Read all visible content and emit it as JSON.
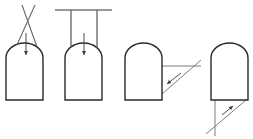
{
  "diagram": {
    "colors": {
      "background": "#ffffff",
      "outline": "#2a2a2a",
      "guide_lines": "#6e6e6e",
      "arrow": "#3a3a3a"
    },
    "panels": [
      {
        "id": "panel-1",
        "shape": {
          "left": 6,
          "right": 43,
          "arch_top": 43,
          "shoulder": 58,
          "bottom": 100
        },
        "lines": [
          {
            "x1": 22,
            "y1": 5,
            "x2": 37,
            "y2": 47
          },
          {
            "x1": 35,
            "y1": 5,
            "x2": 16,
            "y2": 47
          }
        ],
        "arrow": {
          "x1": 26,
          "y1": 33,
          "x2": 26,
          "y2": 55,
          "direction": "down"
        }
      },
      {
        "id": "panel-2",
        "shape": {
          "left": 65,
          "right": 102,
          "arch_top": 43,
          "shoulder": 58,
          "bottom": 100
        },
        "lines": [
          {
            "x1": 55,
            "y1": 10,
            "x2": 112,
            "y2": 10
          },
          {
            "x1": 71,
            "y1": 10,
            "x2": 71,
            "y2": 48
          },
          {
            "x1": 97,
            "y1": 10,
            "x2": 97,
            "y2": 48
          }
        ],
        "arrow": {
          "x1": 84,
          "y1": 33,
          "x2": 84,
          "y2": 55,
          "direction": "down"
        }
      },
      {
        "id": "panel-3",
        "shape": {
          "left": 125,
          "right": 162,
          "arch_top": 43,
          "shoulder": 58,
          "bottom": 100
        },
        "lines": [
          {
            "x1": 162,
            "y1": 66,
            "x2": 201,
            "y2": 66
          },
          {
            "x1": 162,
            "y1": 94,
            "x2": 201,
            "y2": 60
          }
        ],
        "arrow": {
          "x1": 181,
          "y1": 73,
          "x2": 167,
          "y2": 84,
          "direction": "down-left"
        }
      },
      {
        "id": "panel-4",
        "shape": {
          "left": 211,
          "right": 248,
          "arch_top": 43,
          "shoulder": 58,
          "bottom": 100
        },
        "lines": [
          {
            "x1": 215,
            "y1": 100,
            "x2": 215,
            "y2": 136
          },
          {
            "x1": 206,
            "y1": 134,
            "x2": 246,
            "y2": 100
          }
        ],
        "arrow": {
          "x1": 222,
          "y1": 115,
          "x2": 233,
          "y2": 106,
          "direction": "up-right"
        }
      }
    ]
  }
}
